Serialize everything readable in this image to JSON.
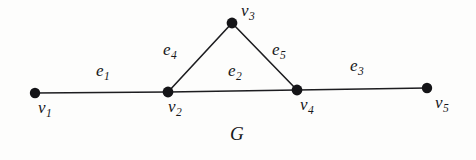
{
  "figure": {
    "name": "graph-diagram",
    "caption": "G",
    "background_color": "#fdfdfc",
    "ink_color": "#17171a",
    "vertices": [
      {
        "id": "v1",
        "base": "v",
        "sub": "1",
        "x": 35,
        "y": 93
      },
      {
        "id": "v2",
        "base": "v",
        "sub": "2",
        "x": 168,
        "y": 92
      },
      {
        "id": "v3",
        "base": "v",
        "sub": "3",
        "x": 232,
        "y": 23
      },
      {
        "id": "v4",
        "base": "v",
        "sub": "4",
        "x": 297,
        "y": 90
      },
      {
        "id": "v5",
        "base": "v",
        "sub": "5",
        "x": 427,
        "y": 88
      }
    ],
    "edges": [
      {
        "id": "e1",
        "base": "e",
        "sub": "1",
        "from": "v1",
        "to": "v2"
      },
      {
        "id": "e2",
        "base": "e",
        "sub": "2",
        "from": "v2",
        "to": "v4"
      },
      {
        "id": "e3",
        "base": "e",
        "sub": "3",
        "from": "v4",
        "to": "v5"
      },
      {
        "id": "e4",
        "base": "e",
        "sub": "4",
        "from": "v2",
        "to": "v3"
      },
      {
        "id": "e5",
        "base": "e",
        "sub": "5",
        "from": "v3",
        "to": "v4"
      }
    ],
    "vertex_labels": [
      {
        "base": "v",
        "sub": "1",
        "x": 38,
        "y": 99
      },
      {
        "base": "v",
        "sub": "2",
        "x": 168,
        "y": 98
      },
      {
        "base": "v",
        "sub": "3",
        "x": 241,
        "y": 2
      },
      {
        "base": "v",
        "sub": "4",
        "x": 300,
        "y": 96
      },
      {
        "base": "v",
        "sub": "5",
        "x": 435,
        "y": 94
      }
    ],
    "edge_labels": [
      {
        "base": "e",
        "sub": "1",
        "x": 96,
        "y": 62
      },
      {
        "base": "e",
        "sub": "2",
        "x": 228,
        "y": 62
      },
      {
        "base": "e",
        "sub": "3",
        "x": 350,
        "y": 57
      },
      {
        "base": "e",
        "sub": "4",
        "x": 163,
        "y": 41
      },
      {
        "base": "e",
        "sub": "5",
        "x": 272,
        "y": 41
      }
    ],
    "graph_label": {
      "text": "G",
      "x": 230,
      "y": 124
    }
  }
}
